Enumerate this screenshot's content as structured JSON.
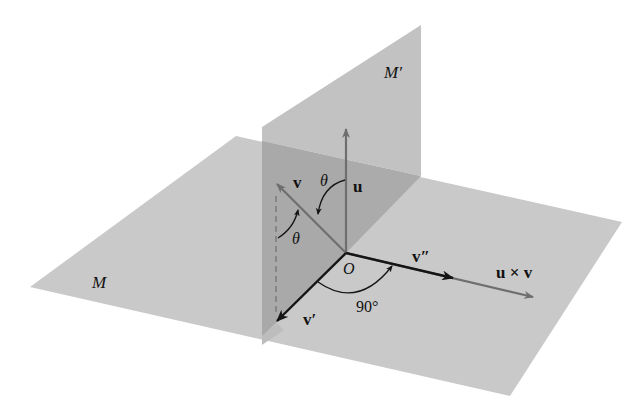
{
  "figure": {
    "planes": [
      {
        "name": "M",
        "label": "M",
        "role": "horizontal plane"
      },
      {
        "name": "M'",
        "label": "M′",
        "role": "vertical plane"
      }
    ],
    "vectors": [
      {
        "name": "u",
        "label": "u"
      },
      {
        "name": "v",
        "label": "v"
      },
      {
        "name": "v'",
        "label": "v′"
      },
      {
        "name": "v''",
        "label": "v″"
      },
      {
        "name": "u x v",
        "label": "u × v"
      }
    ],
    "labels": {
      "plane_m": "M",
      "plane_m_prime": "M′",
      "origin": "O",
      "u": "u",
      "v": "v",
      "v_prime": "v′",
      "v_double_prime": "v″",
      "cross": "u × v",
      "theta_1": "θ",
      "theta_2": "θ",
      "right_angle": "90°"
    },
    "colors": {
      "plane_horizontal": "#c9c9c9",
      "plane_vertical": "#c2c2c2",
      "plane_overlap": "#ababab",
      "gray_vector": "#6e6e6e",
      "black_vector": "#151515"
    }
  }
}
